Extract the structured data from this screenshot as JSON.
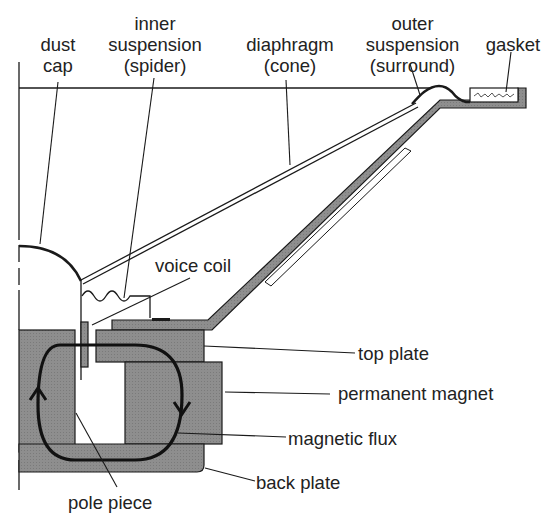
{
  "diagram": {
    "colors": {
      "line": "#1a1a1a",
      "part_fill": "#8e8e8e",
      "background": "#ffffff",
      "text": "#222222"
    },
    "labels": {
      "dust_cap": [
        "dust",
        "cap"
      ],
      "inner_suspension": [
        "inner",
        "suspension",
        "(spider)"
      ],
      "diaphragm": [
        "diaphragm",
        "(cone)"
      ],
      "outer_suspension": [
        "outer",
        "suspension",
        "(surround)"
      ],
      "gasket": "gasket",
      "voice_coil": "voice coil",
      "top_plate": "top plate",
      "permanent_magnet": "permanent magnet",
      "magnetic_flux": "magnetic flux",
      "back_plate": "back plate",
      "pole_piece": "pole piece"
    }
  }
}
